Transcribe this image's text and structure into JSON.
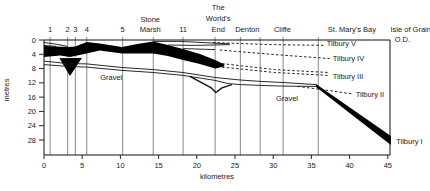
{
  "figure": {
    "kind": "geological-cross-section"
  },
  "chart_data": {
    "type": "area",
    "xlabel": "kilometres",
    "ylabel": "metres",
    "od_label": "O.D.",
    "x_ticks": [
      0,
      5,
      10,
      15,
      20,
      25,
      30,
      35,
      40,
      45
    ],
    "y_ticks": [
      0,
      4,
      8,
      12,
      16,
      20,
      24,
      28
    ],
    "x_range_km": [
      0,
      45.3
    ],
    "depth_range_m": [
      0,
      32.2
    ],
    "grid": false,
    "sites": [
      {
        "label": "1",
        "km": 0.8
      },
      {
        "label": "2",
        "km": 3.1
      },
      {
        "label": "3",
        "km": 4.1
      },
      {
        "label": "4",
        "km": 5.6
      },
      {
        "label": "5",
        "km": 10.3
      },
      {
        "label": "Stone Marsh",
        "lines": [
          "Stone",
          "Marsh"
        ],
        "km": 14.3,
        "label_km": 13.9
      },
      {
        "label": "11",
        "km": 18.2
      },
      {
        "label": "The World's End",
        "lines": [
          "The",
          "World's",
          "End"
        ],
        "km": 22.4,
        "label_km": 22.8
      },
      {
        "label": "Denton",
        "km": 25.7,
        "label_km": 26.6
      },
      {
        "label": "",
        "km": 28.3
      },
      {
        "label": "Cliffe",
        "km": 31.3,
        "label_km": 31.2
      },
      {
        "label": "St. Mary's Bay",
        "km": 35.9,
        "label_km": 40.3
      },
      {
        "label": "Isle of Grain",
        "km": null,
        "label_km": 48.0
      }
    ],
    "fills": [
      {
        "name": "peat-band",
        "top": [
          [
            0,
            1.7
          ],
          [
            3.1,
            2.0
          ],
          [
            4.1,
            1.8
          ],
          [
            5.6,
            0.6
          ],
          [
            7.3,
            1.0
          ],
          [
            10.2,
            2.0
          ],
          [
            12.2,
            1.1
          ],
          [
            14.3,
            0.4
          ],
          [
            16.2,
            1.4
          ],
          [
            18.2,
            2.5
          ],
          [
            20.4,
            3.9
          ],
          [
            22.4,
            5.6
          ],
          [
            23.6,
            6.9
          ]
        ],
        "bottom": [
          [
            0,
            4.8
          ],
          [
            2.1,
            4.3
          ],
          [
            3.4,
            4.8
          ],
          [
            5.6,
            3.8
          ],
          [
            7.3,
            2.9
          ],
          [
            10.2,
            3.8
          ],
          [
            14.3,
            3.8
          ],
          [
            16.2,
            4.5
          ],
          [
            18.2,
            5.6
          ],
          [
            20.4,
            6.7
          ],
          [
            22.4,
            8.0
          ],
          [
            23.6,
            7.4
          ]
        ]
      },
      {
        "name": "peat-spike",
        "points": [
          [
            2.0,
            5.0
          ],
          [
            5.0,
            4.9
          ],
          [
            3.4,
            10.1
          ]
        ]
      },
      {
        "name": "tilbury-I-wedge",
        "points": [
          [
            35.6,
            12.3
          ],
          [
            45.4,
            26.9
          ],
          [
            45.4,
            29.4
          ],
          [
            35.6,
            13.2
          ]
        ]
      }
    ],
    "solid_lines": [
      {
        "name": "upper-left-line-1",
        "points": [
          [
            0,
            0.7
          ],
          [
            1.4,
            1.1
          ],
          [
            3.1,
            1.8
          ]
        ]
      },
      {
        "name": "upper-left-line-2",
        "points": [
          [
            0,
            1.5
          ],
          [
            1.6,
            1.8
          ]
        ]
      },
      {
        "name": "upper-right-line-1",
        "points": [
          [
            14.3,
            0.4
          ],
          [
            17.8,
            0.4
          ],
          [
            24.3,
            1.1
          ]
        ]
      },
      {
        "name": "upper-right-line-2",
        "points": [
          [
            16.2,
            1.4
          ],
          [
            19.8,
            1.5
          ],
          [
            24.3,
            1.3
          ]
        ]
      },
      {
        "name": "upper-right-line-3",
        "points": [
          [
            18.2,
            2.4
          ],
          [
            22.4,
            2.7
          ]
        ]
      },
      {
        "name": "gravel-surface-1",
        "points": [
          [
            0,
            5.9
          ],
          [
            3.1,
            6.6
          ],
          [
            5.6,
            6.7
          ],
          [
            10.2,
            7.7
          ],
          [
            14.3,
            8.3
          ],
          [
            18.2,
            9.1
          ],
          [
            22.4,
            10.5
          ],
          [
            25.7,
            11.2
          ],
          [
            28.3,
            11.6
          ],
          [
            31.3,
            11.9
          ],
          [
            35.6,
            12.5
          ]
        ]
      },
      {
        "name": "gravel-surface-2",
        "points": [
          [
            0,
            6.9
          ],
          [
            3.1,
            7.4
          ],
          [
            5.6,
            7.6
          ],
          [
            10.2,
            8.5
          ],
          [
            14.3,
            9.1
          ],
          [
            18.2,
            9.9
          ],
          [
            22.4,
            11.3
          ],
          [
            24.1,
            12.2
          ],
          [
            25.7,
            12.5
          ],
          [
            28.3,
            12.7
          ],
          [
            31.3,
            12.9
          ],
          [
            35.6,
            13.0
          ]
        ]
      },
      {
        "name": "worlds-end-dip",
        "weight": "bold",
        "points": [
          [
            19.1,
            10.2
          ],
          [
            21.9,
            13.4
          ],
          [
            22.5,
            14.7
          ],
          [
            23.3,
            13.4
          ],
          [
            24.6,
            12.5
          ]
        ]
      }
    ],
    "dashed_lines": [
      {
        "name": "tilbury-V-line",
        "points": [
          [
            22.1,
            0.7
          ],
          [
            29.6,
            1.3
          ],
          [
            36.8,
            1.5
          ]
        ]
      },
      {
        "name": "tilbury-IV-line",
        "points": [
          [
            23.0,
            2.8
          ],
          [
            30.2,
            4.1
          ],
          [
            37.4,
            5.2
          ]
        ]
      },
      {
        "name": "tilbury-III-line-a",
        "points": [
          [
            23.3,
            6.6
          ],
          [
            30.2,
            8.3
          ],
          [
            37.2,
            9.1
          ]
        ]
      },
      {
        "name": "tilbury-III-line-b",
        "points": [
          [
            23.3,
            7.6
          ],
          [
            30.2,
            9.1
          ],
          [
            37.2,
            9.9
          ]
        ]
      },
      {
        "name": "tilbury-II-line",
        "points": [
          [
            33.2,
            13.0
          ],
          [
            36.8,
            14.0
          ],
          [
            40.3,
            15.1
          ]
        ]
      }
    ],
    "bed_labels": [
      {
        "text": "Tilbury V",
        "km": 37.0,
        "m": 1.0
      },
      {
        "text": "Tilbury IV",
        "km": 37.8,
        "m": 5.2
      },
      {
        "text": "Tilbury III",
        "km": 37.8,
        "m": 10.1
      },
      {
        "text": "Tilbury II",
        "km": 40.8,
        "m": 15.1
      },
      {
        "text": "Tilbury I",
        "km": 46.1,
        "m": 28.3
      }
    ],
    "od_position": {
      "km": 45.9,
      "m": -0.3
    },
    "area_labels": [
      {
        "text": "Gravel",
        "km": 8.8,
        "m": 10.6
      },
      {
        "text": "Gravel",
        "km": 31.8,
        "m": 16.4
      }
    ],
    "colors": {
      "ink": "#111111",
      "fill": "#000000",
      "borehole_line": "#555555",
      "background": "#ffffff"
    }
  }
}
